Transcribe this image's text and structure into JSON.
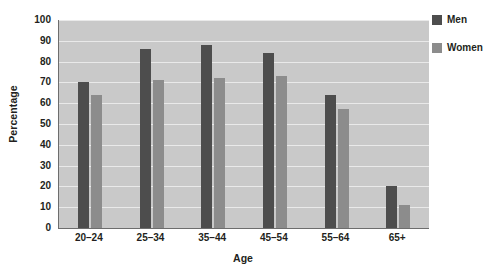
{
  "chart_data": {
    "type": "bar",
    "title": "",
    "xlabel": "Age",
    "ylabel": "Percentage",
    "categories": [
      "20–24",
      "25–34",
      "35–44",
      "45–54",
      "55–64",
      "65+"
    ],
    "series": [
      {
        "name": "Men",
        "color": "#4d4d4d",
        "values": [
          70,
          86,
          88,
          84,
          64,
          20
        ]
      },
      {
        "name": "Women",
        "color": "#8c8c8c",
        "values": [
          64,
          71,
          72,
          73,
          57,
          11
        ]
      }
    ],
    "ylim": [
      0,
      100
    ],
    "ytick_step": 10,
    "yticks": [
      100,
      90,
      80,
      70,
      60,
      50,
      40,
      30,
      20,
      10,
      0
    ],
    "grid": true,
    "legend_position": "right",
    "plot_background": "#c9c9c9",
    "gridline_color": "#e9e9e9",
    "axis_color": "#6d6d6d",
    "page_background": "#ffffff"
  }
}
